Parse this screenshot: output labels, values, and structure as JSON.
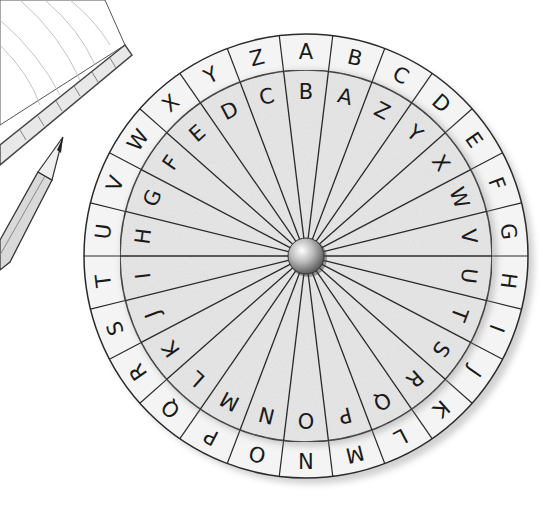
{
  "illustration": {
    "subject": "cipher wheel",
    "style": "pencil sketch",
    "colors": {
      "paper": "#ffffff",
      "outer_ring_fill": "#f4f4f4",
      "inner_disk_fill": "#e6e6e6",
      "line": "#2a2a2a",
      "letter": "#1a1a1a",
      "pin_highlight": "#f0f0f0",
      "pin_shadow": "#6a6a6a"
    },
    "center": [
      306,
      256
    ],
    "outer_radius": 222,
    "inner_ring_radius": 186,
    "hub_radius": 18
  },
  "wheel": {
    "outer_ring": {
      "direction": "clockwise",
      "start_angle_deg": 0,
      "letters": [
        "A",
        "B",
        "C",
        "D",
        "E",
        "F",
        "G",
        "H",
        "I",
        "J",
        "K",
        "L",
        "M",
        "N",
        "O",
        "P",
        "Q",
        "R",
        "S",
        "T",
        "U",
        "V",
        "W",
        "X",
        "Y",
        "Z"
      ]
    },
    "inner_ring": {
      "direction": "clockwise",
      "start_angle_deg": 0,
      "letters": [
        "B",
        "A",
        "Z",
        "Y",
        "X",
        "W",
        "V",
        "U",
        "T",
        "S",
        "R",
        "Q",
        "P",
        "O",
        "N",
        "M",
        "L",
        "K",
        "J",
        "I",
        "H",
        "G",
        "F",
        "E",
        "D",
        "C"
      ]
    }
  },
  "props": {
    "notebook": {
      "label": "notebook",
      "position": "top-left"
    },
    "pencil": {
      "label": "pencil",
      "position": "left"
    }
  }
}
